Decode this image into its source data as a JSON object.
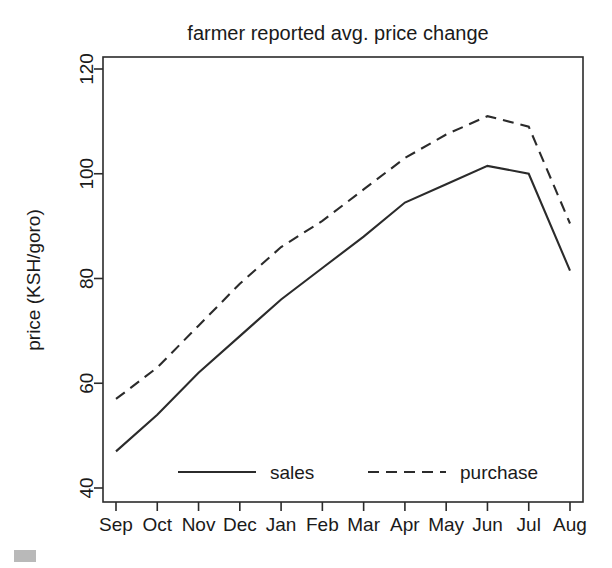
{
  "chart_data": {
    "type": "line",
    "title": "farmer reported avg. price change",
    "xlabel": "",
    "ylabel": "price (KSH/goro)",
    "categories": [
      "Sep",
      "Oct",
      "Nov",
      "Dec",
      "Jan",
      "Feb",
      "Mar",
      "Apr",
      "May",
      "Jun",
      "Jul",
      "Aug"
    ],
    "xtick_labels": [
      "Sep",
      "Oct",
      "Nov",
      "Dec",
      "Jan",
      "Feb",
      "Mar",
      "Apr",
      "May",
      "Jun",
      "Jul",
      "Aug"
    ],
    "ytick_labels": [
      "40",
      "60",
      "80",
      "100",
      "120"
    ],
    "ytick_values": [
      40,
      60,
      80,
      100,
      120
    ],
    "ylim": [
      38,
      122
    ],
    "grid": false,
    "legend_position": "bottom-center-inside",
    "series": [
      {
        "name": "sales",
        "style": "solid",
        "color": "#2b2b2b",
        "values": [
          47,
          54,
          62,
          69,
          76,
          82,
          88,
          94.5,
          98,
          101.5,
          100,
          81.5
        ]
      },
      {
        "name": "purchase",
        "style": "dashed",
        "color": "#2b2b2b",
        "values": [
          57,
          63,
          71,
          79,
          86,
          91,
          97,
          103,
          107.5,
          111,
          109,
          90.5
        ]
      }
    ]
  },
  "legend": {
    "entries": [
      {
        "label": "sales",
        "style": "solid"
      },
      {
        "label": "purchase",
        "style": "dashed"
      }
    ]
  },
  "colors": {
    "ink": "#2b2b2b",
    "background": "#ffffff",
    "corner_mark": "#b9b9b9"
  }
}
